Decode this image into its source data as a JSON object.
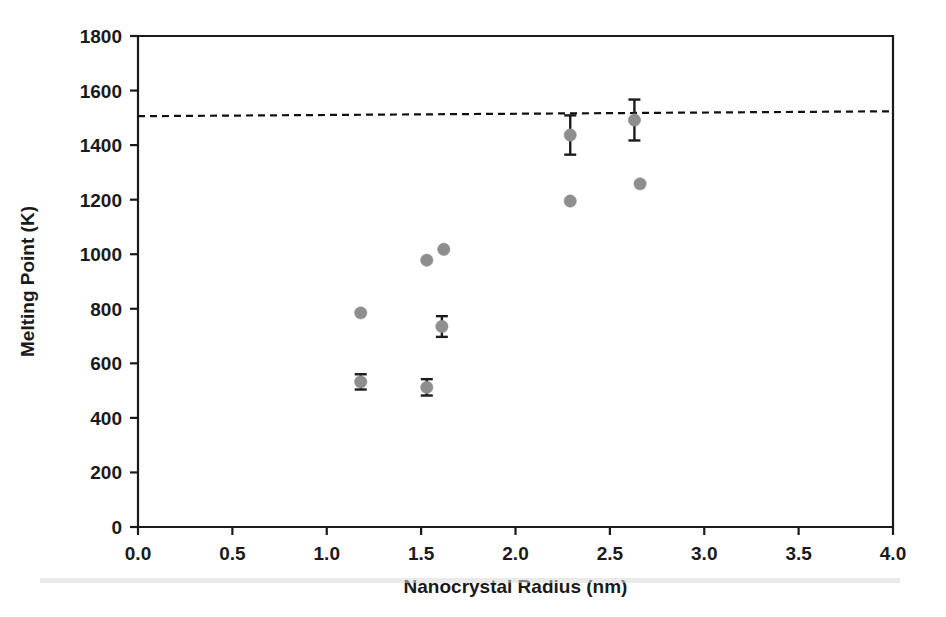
{
  "chart_data": {
    "type": "scatter",
    "title": "",
    "xlabel": "Nanocrystal Radius (nm)",
    "ylabel": "Melting Point (K)",
    "xlim": [
      0.0,
      4.0
    ],
    "ylim": [
      0,
      1800
    ],
    "xticks": [
      "0.0",
      "0.5",
      "1.0",
      "1.5",
      "2.0",
      "2.5",
      "3.0",
      "3.5",
      "4.0"
    ],
    "xtick_values": [
      0.0,
      0.5,
      1.0,
      1.5,
      2.0,
      2.5,
      3.0,
      3.5,
      4.0
    ],
    "yticks": [
      "0",
      "200",
      "400",
      "600",
      "800",
      "1000",
      "1200",
      "1400",
      "1600",
      "1800"
    ],
    "ytick_values": [
      0,
      200,
      400,
      600,
      800,
      1000,
      1200,
      1400,
      1600,
      1800
    ],
    "grid": false,
    "legend": "none",
    "marker_color": "#8e8e8e",
    "errorbar_color": "#1c1c1c",
    "axis_color": "#1a1a1a",
    "points": [
      {
        "x": 1.18,
        "y": 785,
        "yerr": 0
      },
      {
        "x": 1.18,
        "y": 532,
        "yerr": 28
      },
      {
        "x": 1.53,
        "y": 978,
        "yerr": 0
      },
      {
        "x": 1.62,
        "y": 1018,
        "yerr": 0
      },
      {
        "x": 1.61,
        "y": 735,
        "yerr": 38
      },
      {
        "x": 1.53,
        "y": 512,
        "yerr": 30
      },
      {
        "x": 2.29,
        "y": 1437,
        "yerr": 72
      },
      {
        "x": 2.29,
        "y": 1195,
        "yerr": 0
      },
      {
        "x": 2.63,
        "y": 1492,
        "yerr": 75
      },
      {
        "x": 2.66,
        "y": 1258,
        "yerr": 0
      }
    ],
    "reference_line": {
      "label": "bulk melting point",
      "style": "dashed",
      "y_left": 1506,
      "y_right": 1524,
      "x_start": 0.0,
      "x_end": 4.0
    }
  }
}
